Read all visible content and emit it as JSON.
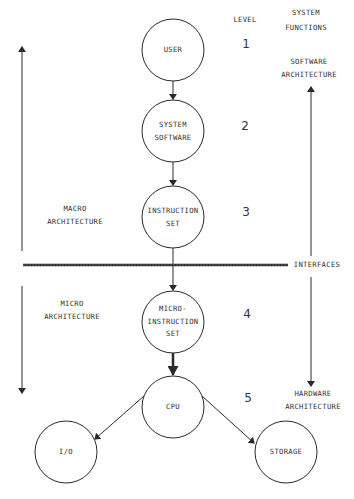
{
  "headers": {
    "level": "LEVEL",
    "system_functions_line1": "SYSTEM",
    "system_functions_line2": "FUNCTIONS"
  },
  "nodes": [
    {
      "id": "user",
      "lines": [
        "USER"
      ],
      "level": "1"
    },
    {
      "id": "system-software",
      "lines": [
        "SYSTEM",
        "SOFTWARE"
      ],
      "level": "2"
    },
    {
      "id": "instruction-set",
      "lines": [
        "INSTRUCTION",
        "SET"
      ],
      "level": "3"
    },
    {
      "id": "micro-instruction-set",
      "lines": [
        "MICRO-",
        "INSTRUCTION",
        "SET"
      ],
      "level": "4"
    },
    {
      "id": "cpu",
      "lines": [
        "CPU"
      ],
      "level": "5"
    },
    {
      "id": "io",
      "lines": [
        "I/O"
      ]
    },
    {
      "id": "storage",
      "lines": [
        "STORAGE"
      ]
    }
  ],
  "left_labels": {
    "macro_line1": "MACRO",
    "macro_line2": "ARCHITECTURE",
    "micro_line1": "MICRO",
    "micro_line2": "ARCHITECTURE"
  },
  "right_labels": {
    "software_line1": "SOFTWARE",
    "software_line2": "ARCHITECTURE",
    "hardware_line1": "HARDWARE",
    "hardware_line2": "ARCHITECTURE",
    "interfaces": "INTERFACES"
  },
  "edges": [
    {
      "from": "user",
      "to": "system-software"
    },
    {
      "from": "system-software",
      "to": "instruction-set"
    },
    {
      "from": "instruction-set",
      "to": "micro-instruction-set",
      "crosses": "interfaces"
    },
    {
      "from": "micro-instruction-set",
      "to": "cpu",
      "style": "bold"
    },
    {
      "from": "cpu",
      "to": "io"
    },
    {
      "from": "cpu",
      "to": "storage"
    }
  ],
  "colors": {
    "line": "#2a2a2a",
    "background": "#ffffff"
  }
}
